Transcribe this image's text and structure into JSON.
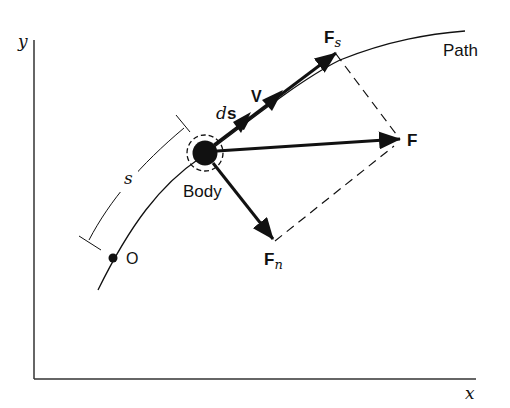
{
  "diagram": {
    "axes": {
      "x_label": "x",
      "y_label": "y"
    },
    "labels": {
      "path": "Path",
      "body": "Body",
      "origin": "O",
      "arc_length": "s",
      "ds_d": "d",
      "ds_s": "s",
      "velocity": "V",
      "force": "F",
      "force_tangential_main": "F",
      "force_tangential_sub": "s",
      "force_normal_main": "F",
      "force_normal_sub": "n"
    },
    "vectors": [
      {
        "name": "ds",
        "description": "differential displacement along path"
      },
      {
        "name": "V",
        "description": "velocity, tangent to path"
      },
      {
        "name": "F",
        "description": "resultant force"
      },
      {
        "name": "Fs",
        "description": "tangential component of F"
      },
      {
        "name": "Fn",
        "description": "normal component of F"
      }
    ],
    "colors": {
      "ink": "#111111",
      "background": "#ffffff"
    }
  }
}
